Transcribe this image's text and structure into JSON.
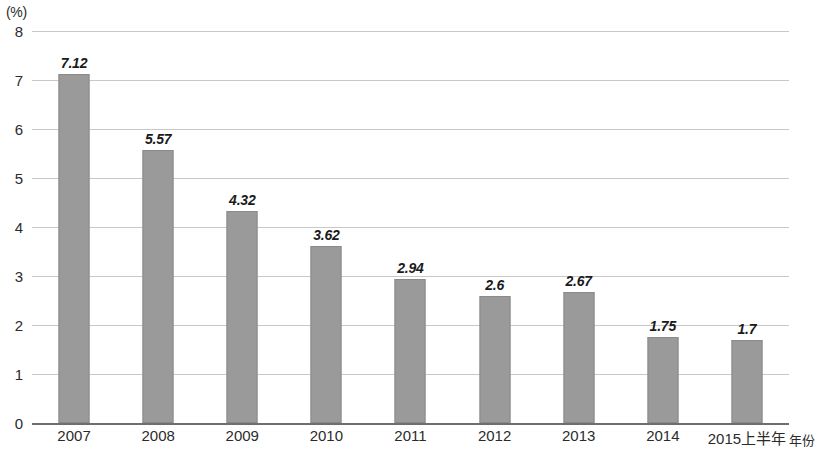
{
  "chart_data": {
    "type": "bar",
    "title": "",
    "subtitle": "",
    "xlabel": "年份",
    "ylabel": "",
    "yunit": "(%)",
    "ylim": [
      0,
      8
    ],
    "ytick_labels": [
      "8",
      "7",
      "6",
      "5",
      "4",
      "3",
      "2",
      "1",
      "0"
    ],
    "ytick_values": [
      8,
      7,
      6,
      5,
      4,
      3,
      2,
      1,
      0
    ],
    "grid": true,
    "legend": "none",
    "categories": [
      "2007",
      "2008",
      "2009",
      "2010",
      "2011",
      "2012",
      "2013",
      "2014",
      "2015上半年"
    ],
    "values": [
      7.12,
      5.57,
      4.32,
      3.62,
      2.94,
      2.6,
      2.67,
      1.75,
      1.7
    ],
    "value_labels": [
      "7.12",
      "5.57",
      "4.32",
      "3.62",
      "2.94",
      "2.6",
      "2.67",
      "1.75",
      "1.7"
    ],
    "bar_color": "#9a9a9a",
    "bar_border_color": "#8a8a8a",
    "gridline_color": "#c8c8c8",
    "axis_color": "#6e6e6e",
    "text_color": "#2b2b2b"
  }
}
